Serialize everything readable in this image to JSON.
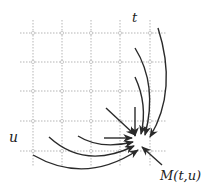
{
  "diagram": {
    "labels": {
      "t": "t",
      "u": "u",
      "point": "M(t,u)"
    },
    "grid": {
      "x_lines": [
        33,
        62,
        91,
        120,
        150
      ],
      "y_lines": [
        33,
        62,
        91,
        121,
        151
      ],
      "x_extent": [
        20,
        166
      ],
      "y_extent": [
        20,
        166
      ],
      "color": "#b5b5b5"
    },
    "target_point": [
      140,
      143
    ],
    "arrow_color": "#2a2a2a"
  }
}
